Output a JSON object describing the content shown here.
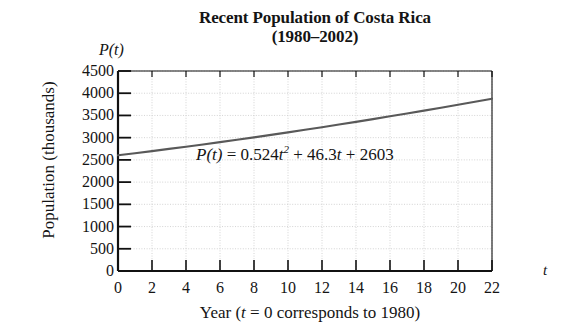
{
  "title": {
    "line1": "Recent Population of Costa Rica",
    "line2": "(1980–2002)"
  },
  "axes": {
    "y_name": "P(t)",
    "x_name": "t",
    "ylabel": "Population (thousands)",
    "xlabel_prefix": "Year (",
    "xlabel_var": "t",
    "xlabel_suffix": " = 0 corresponds to 1980)"
  },
  "annotation": {
    "lhs": "P(t)",
    "equals": "=",
    "coef_quadratic": "0.524",
    "var_quadratic": "t",
    "exponent": "2",
    "plus1": "+",
    "coef_linear": "46.3",
    "var_linear": "t",
    "plus2": "+",
    "constant": "2603",
    "full": "P(t) = 0.524t² + 46.3t + 2603"
  },
  "colors": {
    "curve": "#595959",
    "axis": "#111111",
    "grid": "#cfcfcf",
    "background": "#ffffff",
    "text": "#141414"
  },
  "chart_data": {
    "type": "line",
    "title": "Recent Population of Costa Rica (1980–2002)",
    "xlabel": "Year (t = 0 corresponds to 1980)",
    "ylabel": "Population (thousands)",
    "xlim": [
      0,
      22
    ],
    "ylim": [
      0,
      4500
    ],
    "grid": true,
    "legend": "none",
    "equation": "P(t) = 0.524t^2 + 46.3t + 2603",
    "xticks": [
      0,
      2,
      4,
      6,
      8,
      10,
      12,
      14,
      16,
      18,
      20,
      22
    ],
    "yticks": [
      0,
      500,
      1000,
      1500,
      2000,
      2500,
      3000,
      3500,
      4000,
      4500
    ],
    "series": [
      {
        "name": "P(t) = 0.524t^2 + 46.3t + 2603",
        "x": [
          0,
          1,
          2,
          3,
          4,
          5,
          6,
          7,
          8,
          9,
          10,
          11,
          12,
          13,
          14,
          15,
          16,
          17,
          18,
          19,
          20,
          21,
          22
        ],
        "values": [
          2603,
          2650,
          2698,
          2747,
          2796,
          2847,
          2900,
          2953,
          3007,
          3063,
          3119,
          3177,
          3235,
          3295,
          3355,
          3417,
          3480,
          3543,
          3608,
          3674,
          3740,
          3808,
          3876
        ]
      }
    ]
  }
}
